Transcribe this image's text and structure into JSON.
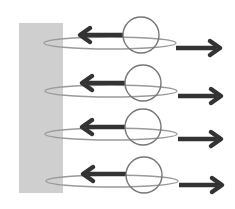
{
  "diagram": {
    "colors": {
      "background": "#ffffff",
      "wall": "#cfcfcf",
      "ellipse": "#9a9a9a",
      "circle": "#777777",
      "arrow": "#333333"
    },
    "wall": {
      "x": 19,
      "y": 23,
      "width": 44,
      "height": 170
    },
    "rows": [
      {
        "ellipse": {
          "cx": 110,
          "cy": 43,
          "rx": 66,
          "ry": 6
        },
        "circle": {
          "cx": 141,
          "cy": 35,
          "r": 18
        },
        "left_arrow": {
          "x1": 123,
          "x2": 80,
          "y": 35
        },
        "right_arrow": {
          "x1": 176,
          "x2": 220,
          "y": 48
        }
      },
      {
        "ellipse": {
          "cx": 111,
          "cy": 91,
          "rx": 66,
          "ry": 6
        },
        "circle": {
          "cx": 143,
          "cy": 83,
          "r": 18
        },
        "left_arrow": {
          "x1": 125,
          "x2": 82,
          "y": 83
        },
        "right_arrow": {
          "x1": 178,
          "x2": 221,
          "y": 96
        }
      },
      {
        "ellipse": {
          "cx": 111,
          "cy": 134,
          "rx": 66,
          "ry": 6
        },
        "circle": {
          "cx": 143,
          "cy": 127,
          "r": 18
        },
        "left_arrow": {
          "x1": 125,
          "x2": 82,
          "y": 127
        },
        "right_arrow": {
          "x1": 178,
          "x2": 221,
          "y": 139
        }
      },
      {
        "ellipse": {
          "cx": 112,
          "cy": 181,
          "rx": 66,
          "ry": 6
        },
        "circle": {
          "cx": 144,
          "cy": 175,
          "r": 18
        },
        "left_arrow": {
          "x1": 126,
          "x2": 83,
          "y": 174
        },
        "right_arrow": {
          "x1": 179,
          "x2": 222,
          "y": 185
        }
      }
    ]
  }
}
